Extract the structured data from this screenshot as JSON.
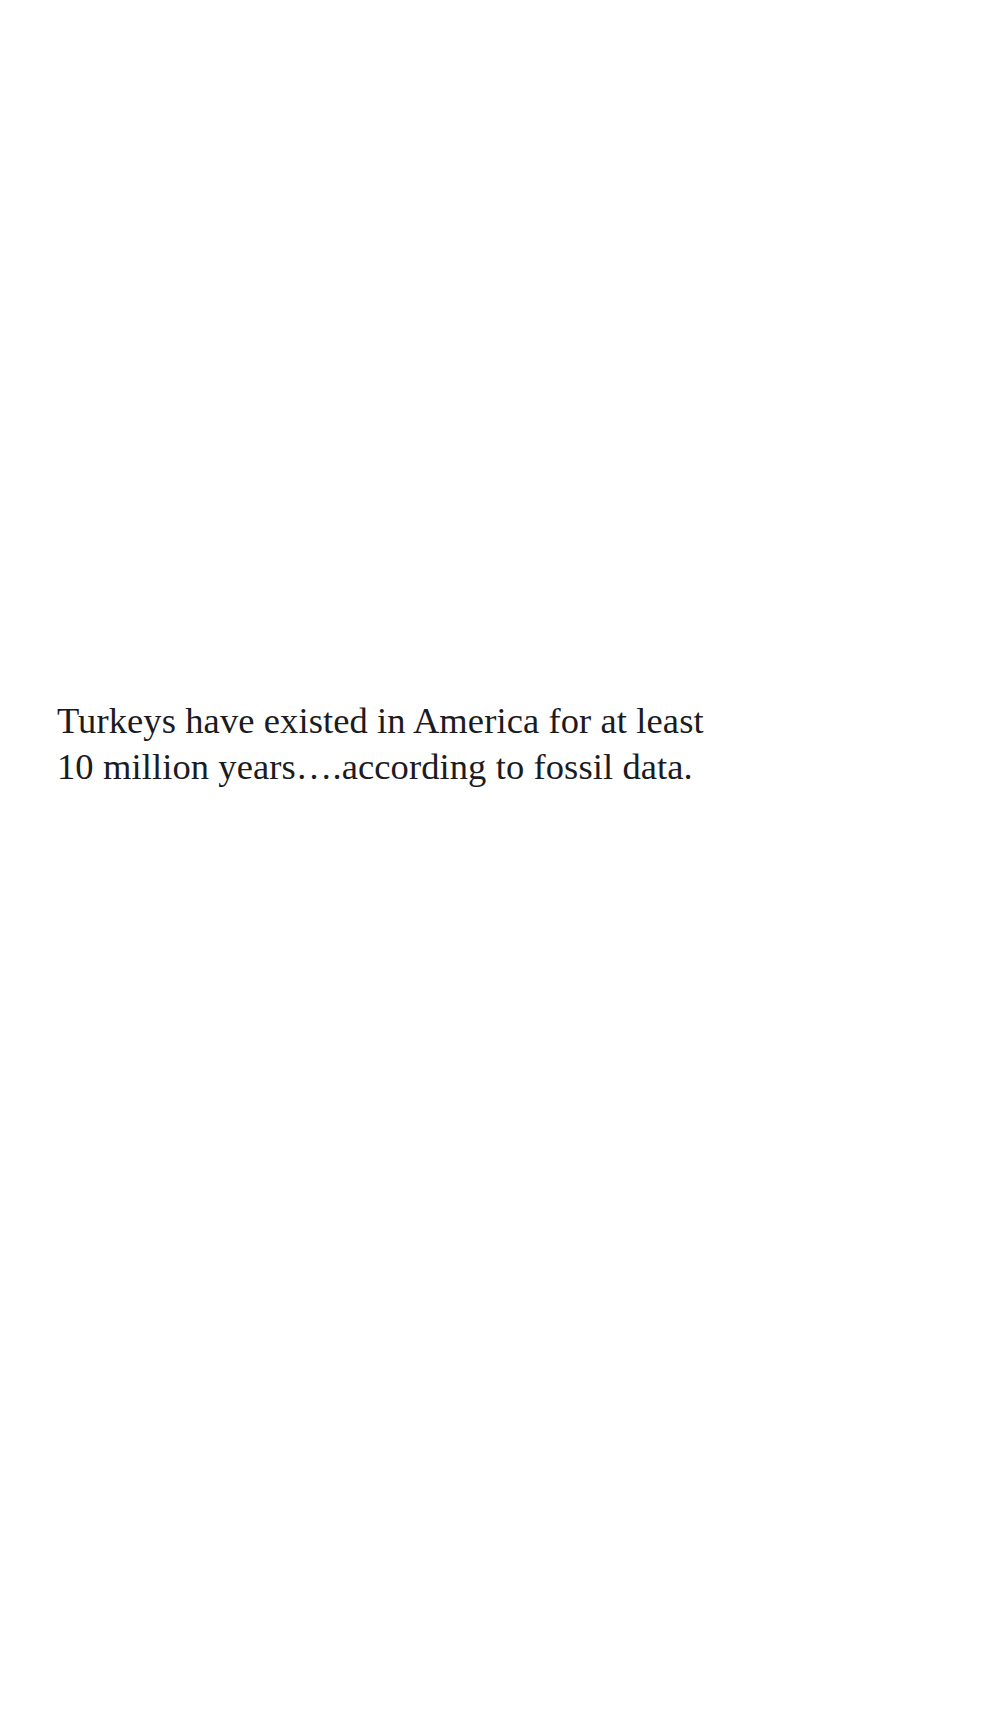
{
  "page": {
    "background_color": "#ffffff",
    "width": 989,
    "height": 1726,
    "kind": "scanned-document-page"
  },
  "body_text": {
    "text_color": "#1b1b22",
    "full_text": "Turkeys have existed in America for at least 10 million years….according to fossil data.",
    "lines": [
      "Turkeys have existed in America for at least",
      "10 million years….according to fossil data."
    ]
  }
}
